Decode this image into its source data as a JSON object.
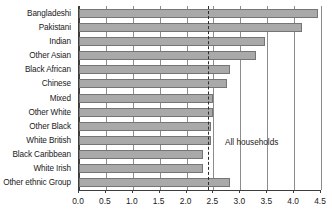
{
  "chart_data": {
    "type": "bar",
    "orientation": "horizontal",
    "title": "",
    "xlabel": "",
    "ylabel": "",
    "xlim": [
      0.0,
      4.5
    ],
    "xticks": [
      0.0,
      0.5,
      1.0,
      1.5,
      2.0,
      2.5,
      3.0,
      3.5,
      4.0,
      4.5
    ],
    "xtick_labels": [
      "0.0",
      "0.5",
      "1.0",
      "1.5",
      "2.0",
      "2.5",
      "3.0",
      "3.5",
      "4.0",
      "4.5"
    ],
    "grid": true,
    "legend": null,
    "categories": [
      "Bangladeshi",
      "Pakistani",
      "Indian",
      "Other Asian",
      "Black African",
      "Chinese",
      "Mixed",
      "Other White",
      "Other Black",
      "White British",
      "Black Caribbean",
      "White Irish",
      "Other ethnic Group"
    ],
    "values": [
      4.45,
      4.15,
      3.45,
      3.3,
      2.8,
      2.75,
      2.5,
      2.5,
      2.45,
      2.45,
      2.3,
      2.3,
      2.8
    ],
    "annotations": [
      {
        "name": "all-households-reference",
        "label": "All households",
        "value": 2.4,
        "style": "dashed-vertical-line"
      }
    ],
    "colors": {
      "bar_fill": "#a9a9a9",
      "bar_border": "#757575",
      "axis": "#3d3d3d",
      "grid": "#8c8c8c",
      "text": "#1a1a1a"
    }
  }
}
